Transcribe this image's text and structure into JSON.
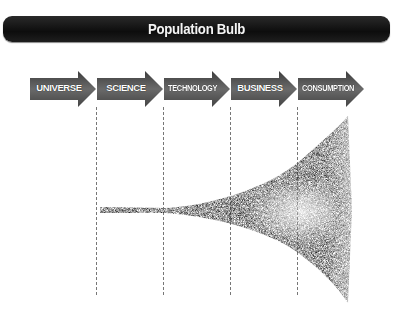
{
  "title": "Population Bulb",
  "stages": [
    {
      "label": "UNIVERSE"
    },
    {
      "label": "SCIENCE"
    },
    {
      "label": "TECHNOLOGY"
    },
    {
      "label": "BUSINESS"
    },
    {
      "label": "CONSUMPTION"
    }
  ],
  "colors": {
    "title_bar": "#111111",
    "title_text": "#f4f4f4",
    "arrow_fill": "#5a5a5a",
    "arrow_text": "#ffffff",
    "dash_line": "#777777",
    "bulb": "#222222"
  },
  "graphic": {
    "name": "population-bulb-shape",
    "description": "narrow stream widening sharply into a bulb at the CONSUMPTION stage"
  }
}
